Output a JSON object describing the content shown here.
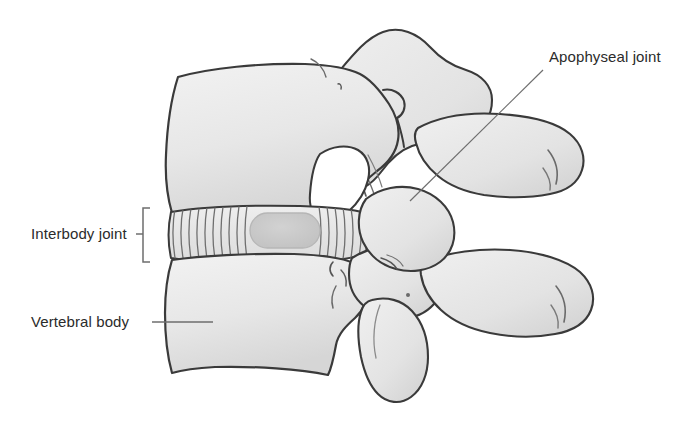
{
  "figure": {
    "type": "anatomical-illustration",
    "width": 681,
    "height": 435,
    "background_color": "#ffffff"
  },
  "colors": {
    "bone_fill": "#e9e9e9",
    "bone_fill_light": "#f0f0f0",
    "bone_shadow": "#cfcfcf",
    "outline": "#3a3a3a",
    "disc_fill": "#ededed",
    "nucleus_fill": "#c9c9c9",
    "nucleus_outline": "#b4b4b4",
    "lamella_line": "#7a7a7a",
    "leader_line": "#6e6e6e",
    "text": "#2b2b2b",
    "foramen": "#ffffff"
  },
  "labels": [
    {
      "id": "apophyseal-joint",
      "text": "Apophyseal joint",
      "x": 549,
      "y": 62,
      "anchor": "start",
      "leader": {
        "x1": 543,
        "y1": 70,
        "x2": 410,
        "y2": 201
      }
    },
    {
      "id": "interbody-joint",
      "text": "Interbody joint",
      "x": 31,
      "y": 238,
      "anchor": "start",
      "bracket": {
        "x": 150,
        "y_top": 208,
        "y_bottom": 262,
        "tick_x": 143,
        "tick_y": 235,
        "depth": 7
      }
    },
    {
      "id": "vertebral-body",
      "text": "Vertebral body",
      "x": 31,
      "y": 327,
      "anchor": "start",
      "leader": {
        "x1": 152,
        "y1": 322,
        "x2": 213,
        "y2": 322
      }
    }
  ],
  "structures": [
    {
      "id": "upper-vertebral-body",
      "name": "Upper vertebral body"
    },
    {
      "id": "lower-vertebral-body",
      "name": "Lower vertebral body"
    },
    {
      "id": "intervertebral-disc",
      "name": "Intervertebral disc (annulus fibrosus)"
    },
    {
      "id": "nucleus-pulposus",
      "name": "Nucleus pulposus"
    },
    {
      "id": "upper-pedicle-lamina",
      "name": "Upper pedicle and lamina"
    },
    {
      "id": "upper-spinous-process",
      "name": "Upper spinous process"
    },
    {
      "id": "lower-spinous-process",
      "name": "Lower spinous process"
    },
    {
      "id": "superior-articular-process",
      "name": "Superior articular process"
    },
    {
      "id": "inferior-articular-process",
      "name": "Inferior articular process"
    },
    {
      "id": "intervertebral-foramen",
      "name": "Intervertebral foramen"
    }
  ]
}
